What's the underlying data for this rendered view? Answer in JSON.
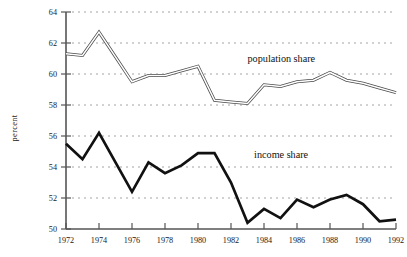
{
  "chart_data": {
    "type": "line",
    "title": "",
    "xlabel": "",
    "ylabel": "percent",
    "xlim": [
      1972,
      1992
    ],
    "ylim": [
      50,
      64
    ],
    "grid": true,
    "grid_orientation": "horizontal",
    "legend_position": "inline-annotation",
    "x": [
      1972,
      1973,
      1974,
      1975,
      1976,
      1977,
      1978,
      1979,
      1980,
      1981,
      1982,
      1983,
      1984,
      1985,
      1986,
      1987,
      1988,
      1989,
      1990,
      1991,
      1992
    ],
    "y_ticks": [
      50,
      52,
      54,
      56,
      58,
      60,
      62,
      64
    ],
    "y_tick_labels": [
      "50",
      "52",
      "54",
      "56",
      "58",
      "60",
      "62",
      "64"
    ],
    "x_ticks": [
      1972,
      1974,
      1976,
      1978,
      1980,
      1982,
      1984,
      1986,
      1988,
      1990,
      1992
    ],
    "x_tick_labels": [
      "1972",
      "1974",
      "1976",
      "1978",
      "1980",
      "1982",
      "1984",
      "1986",
      "1988",
      "1990",
      "1992"
    ],
    "series": [
      {
        "name": "population share",
        "style": "double-line",
        "color": "#4a4a4a",
        "annotation": "population share",
        "values": [
          61.3,
          61.2,
          62.7,
          61.1,
          59.5,
          59.9,
          59.9,
          60.2,
          60.5,
          58.3,
          58.2,
          58.1,
          59.3,
          59.2,
          59.5,
          59.6,
          60.1,
          59.6,
          59.4,
          59.1,
          58.8
        ]
      },
      {
        "name": "income share",
        "style": "solid-thick",
        "color": "#111111",
        "annotation": "income share",
        "values": [
          55.5,
          54.5,
          56.2,
          54.3,
          52.4,
          54.3,
          53.6,
          54.1,
          54.9,
          54.9,
          53.0,
          50.4,
          51.3,
          50.7,
          51.9,
          51.4,
          51.9,
          52.2,
          51.6,
          50.5,
          50.6
        ]
      }
    ],
    "annotations": [
      {
        "text": "population share",
        "x": 1983.0,
        "y": 60.8
      },
      {
        "text": "income share",
        "x": 1983.4,
        "y": 54.6
      }
    ]
  },
  "axis": {
    "y_title": "percent"
  }
}
